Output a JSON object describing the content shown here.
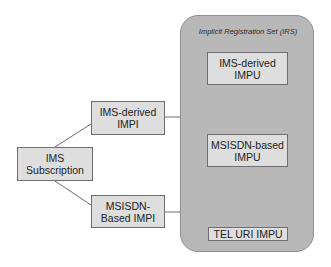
{
  "irs": {
    "title": "Implicit Registration Set (IRS)",
    "fill": "#b8b8b8"
  },
  "nodes": {
    "subscription": {
      "label": "IMS\nSubscription"
    },
    "ims_impi": {
      "label": "IMS-derived\nIMPI"
    },
    "msisdn_impi": {
      "label": "MSISDN-\nBased IMPI"
    },
    "ims_impu": {
      "label": "IMS-derived\nIMPU"
    },
    "msisdn_impu": {
      "label": "MSISDN-based\nIMPU"
    },
    "tel_impu": {
      "label": "TEL URI IMPU"
    }
  },
  "edges": [
    {
      "from": "IMS Subscription",
      "to": "IMS-derived IMPI"
    },
    {
      "from": "IMS Subscription",
      "to": "MSISDN-Based IMPI"
    },
    {
      "from": "IMS-derived IMPI",
      "to": "Implicit Registration Set (IRS)"
    },
    {
      "from": "MSISDN-Based IMPI",
      "to": "Implicit Registration Set (IRS)"
    }
  ]
}
